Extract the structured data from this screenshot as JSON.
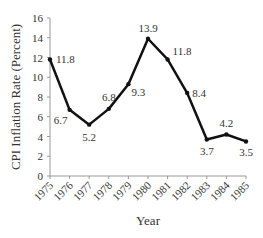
{
  "chart_data": {
    "type": "line",
    "title": "",
    "xlabel": "Year",
    "ylabel": "CPI Inflation Rate (Percent)",
    "categories": [
      "1975",
      "1976",
      "1977",
      "1978",
      "1979",
      "1980",
      "1981",
      "1982",
      "1983",
      "1984",
      "1985"
    ],
    "series": [
      {
        "name": "CPI Inflation Rate",
        "values": [
          11.8,
          6.7,
          5.2,
          6.8,
          9.3,
          13.9,
          11.8,
          8.4,
          3.7,
          4.2,
          3.5
        ],
        "color": "#111111"
      }
    ],
    "data_labels": [
      "11.8",
      "6.7",
      "5.2",
      "6.8",
      "9.3",
      "13.9",
      "11.8",
      "8.4",
      "3.7",
      "4.2",
      "3.5"
    ],
    "yticks": [
      0,
      2,
      4,
      6,
      8,
      10,
      12,
      14,
      16
    ],
    "ylim": [
      0,
      16
    ],
    "grid": false,
    "legend": "none"
  }
}
